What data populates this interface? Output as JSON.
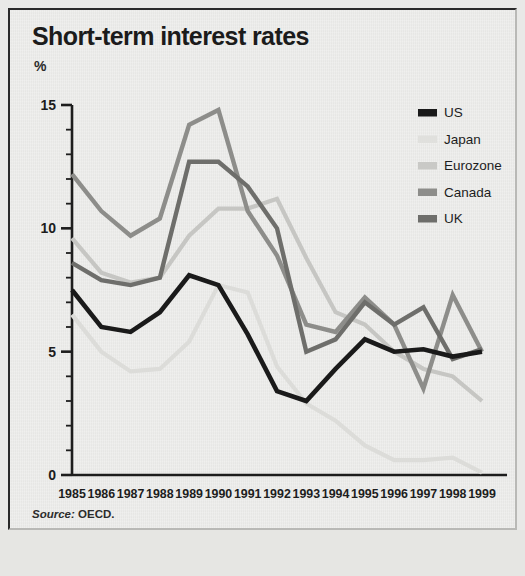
{
  "header": {
    "title": "Short-term interest rates",
    "unit_label": "%"
  },
  "source": {
    "lead": "Source:",
    "value": "OECD."
  },
  "legend": {
    "position": "top-right",
    "entries": [
      {
        "label": "US",
        "color": "#1a1a1a"
      },
      {
        "label": "Japan",
        "color": "#e0e0dd"
      },
      {
        "label": "Eurozone",
        "color": "#c9c9c6"
      },
      {
        "label": "Canada",
        "color": "#8d8d8a"
      },
      {
        "label": "UK",
        "color": "#6e6e6b"
      }
    ]
  },
  "axes": {
    "y_ticks": [
      "0",
      "5",
      "10",
      "15"
    ],
    "y_tick_values": [
      0,
      5,
      10,
      15
    ],
    "y_minor_step": 1,
    "x_ticks": [
      "1985",
      "1986",
      "1987",
      "1988",
      "1989",
      "1990",
      "1991",
      "1992",
      "1993",
      "1994",
      "1995",
      "1996",
      "1997",
      "1998",
      "1999"
    ]
  },
  "chart_data": {
    "type": "line",
    "title": "Short-term interest rates",
    "subtitle": "",
    "xlabel": "",
    "ylabel": "%",
    "ylim": [
      0,
      15
    ],
    "grid": false,
    "legend_position": "top-right",
    "annotations": [
      "Source: OECD."
    ],
    "categories": [
      "1985",
      "1986",
      "1987",
      "1988",
      "1989",
      "1990",
      "1991",
      "1992",
      "1993",
      "1994",
      "1995",
      "1996",
      "1997",
      "1998",
      "1999"
    ],
    "x": [
      1985,
      1986,
      1987,
      1988,
      1989,
      1990,
      1991,
      1992,
      1993,
      1994,
      1995,
      1996,
      1997,
      1998,
      1999
    ],
    "series": [
      {
        "name": "US",
        "color": "#1a1a1a",
        "width": 4.6,
        "values": [
          7.5,
          6.0,
          5.8,
          6.6,
          8.1,
          7.7,
          5.7,
          3.4,
          3.0,
          4.3,
          5.5,
          5.0,
          5.1,
          4.8,
          5.0
        ]
      },
      {
        "name": "Japan",
        "color": "#dcdcd9",
        "width": 4.2,
        "values": [
          6.5,
          5.0,
          4.2,
          4.3,
          5.4,
          7.7,
          7.4,
          4.4,
          2.9,
          2.2,
          1.2,
          0.6,
          0.6,
          0.7,
          0.1
        ]
      },
      {
        "name": "Eurozone",
        "color": "#c6c6c3",
        "width": 4.2,
        "values": [
          9.6,
          8.2,
          7.8,
          8.0,
          9.7,
          10.8,
          10.8,
          11.2,
          8.8,
          6.6,
          6.1,
          5.0,
          4.3,
          4.0,
          3.0
        ]
      },
      {
        "name": "Canada",
        "color": "#8d8d8a",
        "width": 4.4,
        "values": [
          12.2,
          10.7,
          9.7,
          10.4,
          14.2,
          14.8,
          10.7,
          8.9,
          6.1,
          5.8,
          7.2,
          6.1,
          3.5,
          7.3,
          5.0
        ]
      },
      {
        "name": "UK",
        "color": "#6e6e6b",
        "width": 4.4,
        "values": [
          8.6,
          7.9,
          7.7,
          8.0,
          12.7,
          12.7,
          11.7,
          10.0,
          5.0,
          5.5,
          7.0,
          6.1,
          6.8,
          4.7,
          5.1
        ]
      }
    ]
  }
}
